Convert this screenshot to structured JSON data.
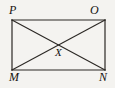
{
  "figure": {
    "type": "geometry-diagram",
    "shape": "rectangle-with-diagonals",
    "background_color": "#f4f3f0",
    "stroke_color": "#2b2824",
    "stroke_width": 1.2,
    "label_color": "#14120f",
    "rectangle": {
      "name": "MNOP",
      "left": 12,
      "top": 20,
      "right": 105,
      "bottom": 70
    },
    "vertices": [
      {
        "id": "p",
        "label": "P",
        "x": 12,
        "y": 20,
        "position": "top-left"
      },
      {
        "id": "o",
        "label": "O",
        "x": 105,
        "y": 20,
        "position": "top-right"
      },
      {
        "id": "m",
        "label": "M",
        "x": 12,
        "y": 70,
        "position": "bottom-left"
      },
      {
        "id": "n",
        "label": "N",
        "x": 105,
        "y": 70,
        "position": "bottom-right"
      }
    ],
    "intersection": {
      "id": "x",
      "label": "X",
      "x": 58.5,
      "y": 45
    },
    "diagonals": [
      {
        "id": "diagonal-mo",
        "from": "M",
        "to": "O"
      },
      {
        "id": "diagonal-pn",
        "from": "P",
        "to": "N"
      }
    ],
    "edges": [
      {
        "id": "edge-po",
        "from": "P",
        "to": "O"
      },
      {
        "id": "edge-on",
        "from": "O",
        "to": "N"
      },
      {
        "id": "edge-nm",
        "from": "N",
        "to": "M"
      },
      {
        "id": "edge-mp",
        "from": "M",
        "to": "P"
      }
    ]
  }
}
